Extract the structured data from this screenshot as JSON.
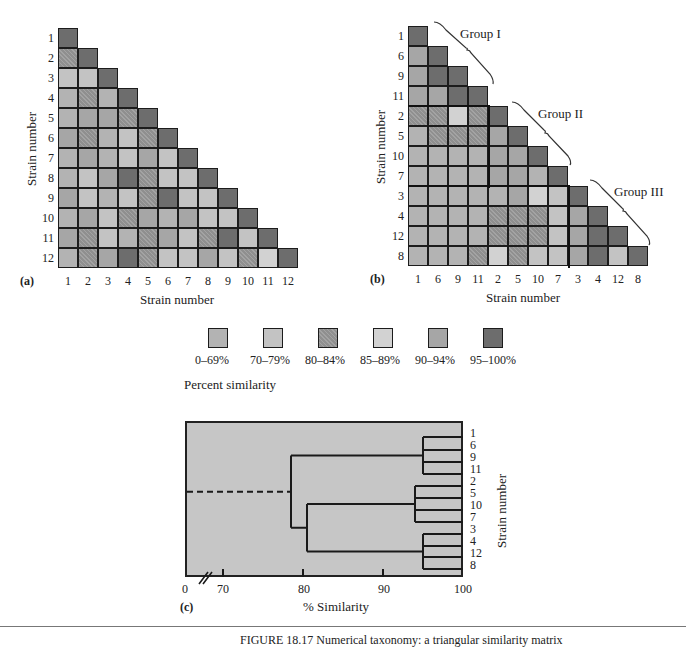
{
  "chart_data": [
    {
      "type": "heatmap",
      "panel": "(a)",
      "title": "",
      "xlabel": "Strain number",
      "ylabel": "Strain number",
      "order": [
        "1",
        "2",
        "3",
        "4",
        "5",
        "6",
        "7",
        "8",
        "9",
        "10",
        "11",
        "12"
      ],
      "shape": "lower-triangular",
      "legend_key": {
        "A": "0–69%",
        "B": "70–79%",
        "C": "80–84%",
        "D": "85–89%",
        "E": "90–94%",
        "F": "95–100%"
      },
      "rows": [
        [
          "F"
        ],
        [
          "C",
          "F"
        ],
        [
          "B",
          "B",
          "F"
        ],
        [
          "A",
          "C",
          "A",
          "F"
        ],
        [
          "A",
          "E",
          "E",
          "C",
          "F"
        ],
        [
          "E",
          "C",
          "A",
          "B",
          "C",
          "F"
        ],
        [
          "A",
          "E",
          "A",
          "B",
          "E",
          "B",
          "F"
        ],
        [
          "A",
          "B",
          "E",
          "F",
          "C",
          "B",
          "B",
          "F"
        ],
        [
          "E",
          "B",
          "A",
          "B",
          "C",
          "F",
          "B",
          "B",
          "F"
        ],
        [
          "A",
          "E",
          "B",
          "C",
          "E",
          "A",
          "E",
          "B",
          "B",
          "F"
        ],
        [
          "E",
          "C",
          "B",
          "A",
          "C",
          "E",
          "B",
          "C",
          "F",
          "B",
          "F"
        ],
        [
          "A",
          "C",
          "E",
          "F",
          "C",
          "B",
          "B",
          "E",
          "B",
          "C",
          "D",
          "F"
        ]
      ]
    },
    {
      "type": "heatmap",
      "panel": "(b)",
      "title": "",
      "xlabel": "Strain number",
      "ylabel": "Strain number",
      "order": [
        "1",
        "6",
        "9",
        "11",
        "2",
        "5",
        "10",
        "7",
        "3",
        "4",
        "12",
        "8"
      ],
      "shape": "lower-triangular",
      "groups": [
        {
          "name": "Group I",
          "strains": [
            "1",
            "6",
            "9",
            "11"
          ]
        },
        {
          "name": "Group II",
          "strains": [
            "2",
            "5",
            "10",
            "7"
          ]
        },
        {
          "name": "Group III",
          "strains": [
            "3",
            "4",
            "12",
            "8"
          ]
        }
      ],
      "rows": [
        [
          "F"
        ],
        [
          "E",
          "F"
        ],
        [
          "E",
          "F",
          "F"
        ],
        [
          "E",
          "E",
          "F",
          "F"
        ],
        [
          "C",
          "C",
          "D",
          "C",
          "F"
        ],
        [
          "A",
          "C",
          "C",
          "C",
          "E",
          "F"
        ],
        [
          "A",
          "A",
          "A",
          "A",
          "E",
          "E",
          "F"
        ],
        [
          "A",
          "A",
          "A",
          "A",
          "E",
          "E",
          "A",
          "F"
        ],
        [
          "A",
          "A",
          "A",
          "A",
          "A",
          "E",
          "D",
          "B",
          "F"
        ],
        [
          "A",
          "A",
          "A",
          "A",
          "C",
          "C",
          "C",
          "B",
          "E",
          "F"
        ],
        [
          "A",
          "A",
          "A",
          "A",
          "C",
          "C",
          "C",
          "B",
          "E",
          "F",
          "F"
        ],
        [
          "A",
          "A",
          "A",
          "C",
          "D",
          "C",
          "B",
          "B",
          "E",
          "F",
          "B",
          "F"
        ]
      ]
    },
    {
      "type": "dendrogram",
      "panel": "(c)",
      "xlabel": "% Similarity",
      "ylabel": "Strain number",
      "x_ticks": [
        "0",
        "70",
        "80",
        "90",
        "100"
      ],
      "xlim": [
        65,
        100
      ],
      "axis_break": true,
      "leaf_order": [
        "1",
        "6",
        "9",
        "11",
        "2",
        "5",
        "10",
        "7",
        "3",
        "4",
        "12",
        "8"
      ],
      "clusters": [
        {
          "name": "Group I",
          "members": [
            "1",
            "6",
            "9",
            "11"
          ],
          "join_similarity": 95
        },
        {
          "name": "Group II",
          "members": [
            "2",
            "5",
            "10",
            "7"
          ],
          "join_similarity": 94
        },
        {
          "name": "Group III",
          "members": [
            "3",
            "4",
            "12",
            "8"
          ],
          "join_similarity": 95
        },
        {
          "name": "Group II + III",
          "join_similarity": 80.5
        },
        {
          "name": "All",
          "join_similarity": 78.5
        }
      ],
      "root_dashed": true
    }
  ],
  "legend": {
    "title": "Percent similarity",
    "items": [
      {
        "key": "A",
        "label": "0–69%",
        "color": "#b3b3b3"
      },
      {
        "key": "B",
        "label": "70–79%",
        "color": "#c3c3c3"
      },
      {
        "key": "C",
        "label": "80–84%",
        "color": "#8f8f8f",
        "hatched": true
      },
      {
        "key": "D",
        "label": "85–89%",
        "color": "#d2d2d2"
      },
      {
        "key": "E",
        "label": "90–94%",
        "color": "#a6a6a6"
      },
      {
        "key": "F",
        "label": "95–100%",
        "color": "#6d6d6d"
      }
    ]
  },
  "panel_a": {
    "label": "(a)",
    "xlabel": "Strain number",
    "ylabel": "Strain number"
  },
  "panel_b": {
    "label": "(b)",
    "xlabel": "Strain number",
    "ylabel": "Strain number",
    "group_labels": [
      "Group I",
      "Group II",
      "Group III"
    ]
  },
  "panel_c": {
    "label": "(c)",
    "xlabel": "% Similarity",
    "ylabel": "Strain number"
  },
  "caption": "FIGURE 18.17   Numerical taxonomy: a triangular similarity matrix"
}
